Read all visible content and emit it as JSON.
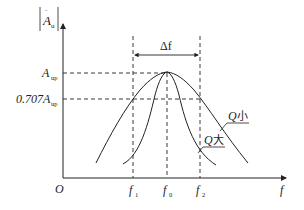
{
  "diagram": {
    "type": "frequency-response",
    "y_axis_label_main": "A",
    "y_axis_label_sub": "u",
    "x_axis_label": "f",
    "origin_label": "O",
    "y_ticks": [
      {
        "label": "A",
        "sub": "up"
      },
      {
        "label": "0.707A",
        "sub": "up"
      }
    ],
    "x_ticks": [
      {
        "label": "f",
        "sub": "1"
      },
      {
        "label": "f",
        "sub": "0"
      },
      {
        "label": "f",
        "sub": "2"
      }
    ],
    "bandwidth_label": "Δf",
    "curves": [
      {
        "name": "Q小",
        "q": "Q",
        "suffix": "小"
      },
      {
        "name": "Q大",
        "q": "Q",
        "suffix": "大"
      }
    ],
    "colors": {
      "line": "#222222",
      "background": "#ffffff"
    }
  }
}
